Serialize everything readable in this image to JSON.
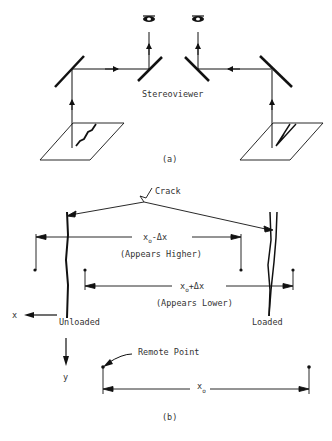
{
  "panel_a": {
    "caption": "(a)",
    "stereoviewer_label": "Stereoviewer",
    "left_eye_icon": "eye-icon",
    "right_eye_icon": "eye-icon"
  },
  "panel_b": {
    "caption": "(b)",
    "crack_label": "Crack",
    "upper_dim": {
      "main": "x",
      "sub": "o",
      "suffix": "-Δx",
      "note": "(Appears Higher)"
    },
    "lower_dim": {
      "main": "x",
      "sub": "o",
      "suffix": "+Δx",
      "note": "(Appears Lower)"
    },
    "axis_x_label": "x",
    "axis_y_label": "y",
    "unloaded_label": "Unloaded",
    "loaded_label": "Loaded",
    "remote_point_label": "Remote Point",
    "bottom_dim": {
      "main": "x",
      "sub": "o"
    }
  },
  "colors": {
    "ink": "#111111",
    "text": "#333333",
    "background": "#ffffff"
  }
}
